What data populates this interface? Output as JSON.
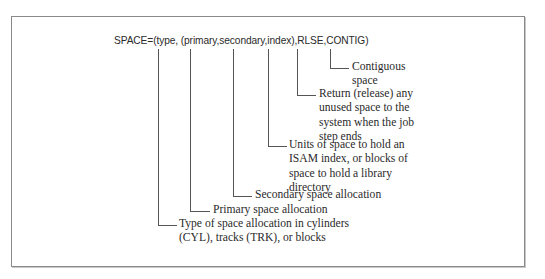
{
  "diagram": {
    "syntax": "SPACE=(type, (primary,secondary,index),RLSE,CONTIG)",
    "annotations": [
      {
        "id": "contig",
        "param": "CONTIG",
        "lines": [
          "Contiguous",
          "space"
        ]
      },
      {
        "id": "rlse",
        "param": "RLSE",
        "lines": [
          "Return (release) any",
          "unused space to the",
          "system when the job",
          "step ends"
        ]
      },
      {
        "id": "index",
        "param": "index",
        "lines": [
          "Units of space to hold an",
          "ISAM index, or blocks of",
          "space to hold a library",
          "directory"
        ]
      },
      {
        "id": "secondary",
        "param": "secondary",
        "lines": [
          "Secondary space allocation"
        ]
      },
      {
        "id": "primary",
        "param": "primary",
        "lines": [
          "Primary space allocation"
        ]
      },
      {
        "id": "type",
        "param": "type",
        "lines": [
          "Type of space allocation in cylinders",
          "(CYL), tracks (TRK), or blocks"
        ]
      }
    ]
  }
}
